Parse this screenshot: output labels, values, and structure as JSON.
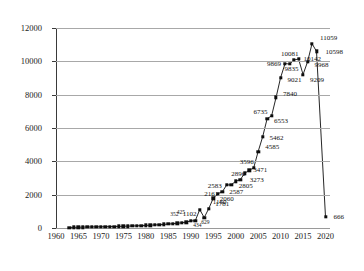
{
  "chart_data": {
    "type": "line",
    "title": "",
    "subtitle": "",
    "xlabel": "",
    "ylabel": "",
    "xlim": [
      1960,
      2021
    ],
    "ylim": [
      0,
      12000
    ],
    "grid": true,
    "legend": null,
    "marker": "filled-square",
    "series_color": "#0d0d0d",
    "grid_color": "#a8a8a8",
    "axis_color": "#3a3a3a",
    "y_ticks": [
      0,
      2000,
      4000,
      6000,
      8000,
      10000,
      12000
    ],
    "y_tick_labels": [
      "0",
      "2000",
      "4000",
      "6000",
      "8000",
      "10000",
      "12000"
    ],
    "x_ticks": [
      1960,
      1965,
      1970,
      1975,
      1980,
      1985,
      1990,
      1995,
      2000,
      2005,
      2010,
      2015,
      2020
    ],
    "x_tick_labels": [
      "1960",
      "1965",
      "1970",
      "1975",
      "1980",
      "1985",
      "1990",
      "1995",
      "2000",
      "2005",
      "2010",
      "2015",
      "2020"
    ],
    "series": [
      {
        "name": "values",
        "points": [
          {
            "x": 1963,
            "y": 30,
            "label": ""
          },
          {
            "x": 1964,
            "y": 38,
            "label": ""
          },
          {
            "x": 1965,
            "y": 45,
            "label": ""
          },
          {
            "x": 1966,
            "y": 52,
            "label": ""
          },
          {
            "x": 1967,
            "y": 58,
            "label": ""
          },
          {
            "x": 1968,
            "y": 63,
            "label": ""
          },
          {
            "x": 1969,
            "y": 68,
            "label": ""
          },
          {
            "x": 1970,
            "y": 72,
            "label": ""
          },
          {
            "x": 1971,
            "y": 78,
            "label": ""
          },
          {
            "x": 1972,
            "y": 84,
            "label": ""
          },
          {
            "x": 1973,
            "y": 90,
            "label": ""
          },
          {
            "x": 1974,
            "y": 96,
            "label": ""
          },
          {
            "x": 1975,
            "y": 104,
            "label": ""
          },
          {
            "x": 1976,
            "y": 112,
            "label": ""
          },
          {
            "x": 1977,
            "y": 120,
            "label": ""
          },
          {
            "x": 1978,
            "y": 130,
            "label": ""
          },
          {
            "x": 1979,
            "y": 142,
            "label": ""
          },
          {
            "x": 1980,
            "y": 155,
            "label": ""
          },
          {
            "x": 1981,
            "y": 168,
            "label": ""
          },
          {
            "x": 1982,
            "y": 182,
            "label": ""
          },
          {
            "x": 1983,
            "y": 198,
            "label": ""
          },
          {
            "x": 1984,
            "y": 215,
            "label": ""
          },
          {
            "x": 1985,
            "y": 235,
            "label": ""
          },
          {
            "x": 1986,
            "y": 258,
            "label": ""
          },
          {
            "x": 1987,
            "y": 285,
            "label": ""
          },
          {
            "x": 1988,
            "y": 315,
            "label": ""
          },
          {
            "x": 1989,
            "y": 352,
            "label": "352"
          },
          {
            "x": 1990,
            "y": 425,
            "label": "425"
          },
          {
            "x": 1991,
            "y": 434,
            "label": "434"
          },
          {
            "x": 1992,
            "y": 1102,
            "label": "1102"
          },
          {
            "x": 1993,
            "y": 629,
            "label": "629"
          },
          {
            "x": 1994,
            "y": 1160,
            "label": "1160"
          },
          {
            "x": 1995,
            "y": 1781,
            "label": "1781"
          },
          {
            "x": 1996,
            "y": 2060,
            "label": "2060"
          },
          {
            "x": 1997,
            "y": 2161,
            "label": "2161"
          },
          {
            "x": 1998,
            "y": 2583,
            "label": "2583"
          },
          {
            "x": 1999,
            "y": 2587,
            "label": "2587"
          },
          {
            "x": 2000,
            "y": 2805,
            "label": "2805"
          },
          {
            "x": 2001,
            "y": 2896,
            "label": "2896"
          },
          {
            "x": 2002,
            "y": 3273,
            "label": "3273"
          },
          {
            "x": 2003,
            "y": 3471,
            "label": "3471"
          },
          {
            "x": 2004,
            "y": 3596,
            "label": "3596"
          },
          {
            "x": 2005,
            "y": 4585,
            "label": "4585"
          },
          {
            "x": 2006,
            "y": 5462,
            "label": "5462"
          },
          {
            "x": 2007,
            "y": 6553,
            "label": "6553"
          },
          {
            "x": 2008,
            "y": 6735,
            "label": "6735"
          },
          {
            "x": 2009,
            "y": 7840,
            "label": "7840"
          },
          {
            "x": 2010,
            "y": 9021,
            "label": "9021"
          },
          {
            "x": 2011,
            "y": 9869,
            "label": "9869"
          },
          {
            "x": 2012,
            "y": 9835,
            "label": "9835"
          },
          {
            "x": 2013,
            "y": 10081,
            "label": "10081"
          },
          {
            "x": 2014,
            "y": 10142,
            "label": "10142"
          },
          {
            "x": 2015,
            "y": 9209,
            "label": "9209"
          },
          {
            "x": 2016,
            "y": 9968,
            "label": "9968"
          },
          {
            "x": 2017,
            "y": 11059,
            "label": "11059"
          },
          {
            "x": 2018,
            "y": 10598,
            "label": "10598"
          },
          {
            "x": 2020,
            "y": 666,
            "label": "666"
          }
        ]
      }
    ]
  }
}
